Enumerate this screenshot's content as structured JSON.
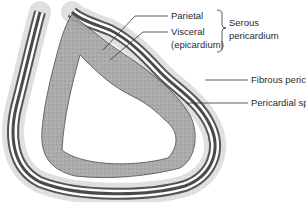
{
  "diagram": {
    "title": "",
    "labels": {
      "parietal": "Parietal",
      "visceral": "Visceral",
      "epicardium": "(epicardium)",
      "serous_line1": "Serous",
      "serous_line2": "pericardium",
      "fibrous": "Fibrous pericardium",
      "pericardial_space": "Pericardial space"
    },
    "colors": {
      "background": "#ffffff",
      "outline": "#3a3a3a",
      "fibrous_fill": "#d9d9d9",
      "dark_band": "#555555",
      "myocardium_fill": "#a8a8a8",
      "leader_line": "#333333"
    }
  }
}
